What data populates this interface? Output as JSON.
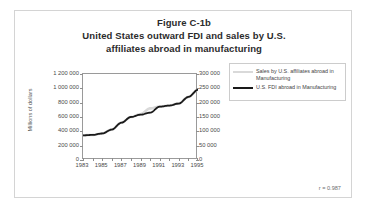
{
  "figure": {
    "title_lines": [
      "Figure C-1b",
      "United States outward FDI and sales by U.S.",
      "affiliates abroad in manufacturing"
    ],
    "correlation_note": "r = 0.987"
  },
  "legend": {
    "entries": [
      {
        "label": "Sales by U.S. affiliates abroad in Manufacturing",
        "color": "#d9d9d9"
      },
      {
        "label": "U.S. FDI abroad in Manufacturing",
        "color": "#1a1a1a"
      }
    ]
  },
  "chart_data": {
    "type": "line",
    "title": "United States outward FDI and sales by U.S. affiliates abroad in manufacturing",
    "xlabel": "",
    "ylabel": "Millions of dollars",
    "y2label": "",
    "grid": false,
    "legend_position": "right",
    "x": [
      1983,
      1984,
      1985,
      1986,
      1987,
      1988,
      1989,
      1990,
      1991,
      1992,
      1993,
      1994,
      1995
    ],
    "xtick_labels": [
      "1983",
      "1985",
      "1987",
      "1989",
      "1991",
      "1993",
      "1995"
    ],
    "xtick_values": [
      1983,
      1985,
      1987,
      1989,
      1991,
      1993,
      1995
    ],
    "xlim": [
      1983,
      1995
    ],
    "ylim": [
      0,
      1200000
    ],
    "ytick_labels": [
      "0",
      "200 000",
      "400 000",
      "600 000",
      "800 000",
      "1 000 000",
      "1 200 000"
    ],
    "ytick_values": [
      0,
      200000,
      400000,
      600000,
      800000,
      1000000,
      1200000
    ],
    "y2lim": [
      0,
      300000
    ],
    "y2tick_labels": [
      "0",
      "50 000",
      "100 000",
      "150 000",
      "200 000",
      "250 000",
      "300 000"
    ],
    "y2tick_values": [
      0,
      50000,
      100000,
      150000,
      200000,
      250000,
      300000
    ],
    "series": [
      {
        "name": "Sales by U.S. affiliates abroad in Manufacturing",
        "axis": "left",
        "color": "#d9d9d9",
        "values": [
          345000,
          350000,
          370000,
          425000,
          520000,
          600000,
          640000,
          720000,
          745000,
          760000,
          790000,
          880000,
          980000
        ]
      },
      {
        "name": "U.S. FDI abroad in Manufacturing",
        "axis": "right",
        "color": "#1a1a1a",
        "values": [
          86000,
          87500,
          92500,
          106000,
          130000,
          150000,
          158000,
          165000,
          186000,
          190000,
          197000,
          220000,
          245000
        ]
      }
    ],
    "annotations": [
      "r = 0.987"
    ]
  }
}
